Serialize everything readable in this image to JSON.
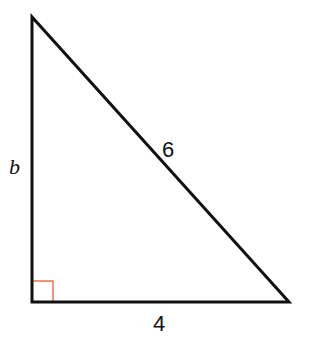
{
  "diagram": {
    "type": "right-triangle",
    "vertices": {
      "top": [
        32,
        17
      ],
      "right_angle": [
        32,
        302
      ],
      "bottom_right": [
        289,
        302
      ]
    },
    "colors": {
      "stroke": "#111111",
      "right_angle_marker": "#d9542b",
      "background": "#ffffff"
    },
    "labels": {
      "vertical_leg": "b",
      "hypotenuse": "6",
      "base": "4"
    }
  }
}
